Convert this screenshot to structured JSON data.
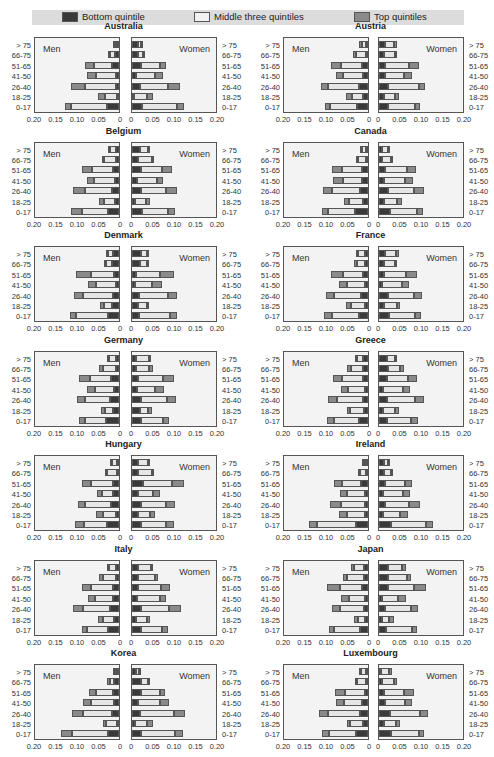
{
  "legend": {
    "items": [
      {
        "label": "Bottom quintile",
        "color": "#3a3a3a"
      },
      {
        "label": "Middle three quintiles",
        "color": "#e6e6e6"
      },
      {
        "label": "Top quintiles",
        "color": "#8a8a8a"
      }
    ]
  },
  "labels": {
    "men": "Men",
    "women": "Women"
  },
  "chart_data": {
    "type": "bar",
    "subtype": "population-pyramid (stacked horizontal, mirrored)",
    "age_groups": [
      "> 75",
      "66-75",
      "51-65",
      "41-50",
      "26-40",
      "18-25",
      "0-17"
    ],
    "segments": [
      "Bottom quintile",
      "Middle three quintiles",
      "Top quintiles"
    ],
    "x_ticks_men": [
      "0.20",
      "0.15",
      "0.10",
      "0.05",
      "0"
    ],
    "x_ticks_women": [
      "0",
      "0.05",
      "0.10",
      "0.15",
      "0.20"
    ],
    "xlim": [
      0,
      0.2
    ],
    "note": "Each bar given as [bottom, middle, top] share widths; order of bars follows age_groups (top to bottom).",
    "countries": [
      {
        "name": "Australia",
        "men": [
          [
            0.005,
            0.005,
            0.004
          ],
          [
            0.011,
            0.011,
            0.003
          ],
          [
            0.016,
            0.043,
            0.021
          ],
          [
            0.006,
            0.048,
            0.02
          ],
          [
            0.008,
            0.07,
            0.033
          ],
          [
            0.003,
            0.03,
            0.016
          ],
          [
            0.027,
            0.085,
            0.014
          ]
        ],
        "women": [
          [
            0.015,
            0.008,
            0.002
          ],
          [
            0.015,
            0.012,
            0.003
          ],
          [
            0.022,
            0.043,
            0.015
          ],
          [
            0.009,
            0.045,
            0.018
          ],
          [
            0.018,
            0.065,
            0.028
          ],
          [
            0.005,
            0.03,
            0.013
          ],
          [
            0.023,
            0.082,
            0.015
          ]
        ]
      },
      {
        "name": "Austria",
        "men": [
          [
            0.003,
            0.012,
            0.005
          ],
          [
            0.005,
            0.023,
            0.006
          ],
          [
            0.013,
            0.05,
            0.022
          ],
          [
            0.011,
            0.048,
            0.016
          ],
          [
            0.022,
            0.07,
            0.018
          ],
          [
            0.012,
            0.025,
            0.014
          ],
          [
            0.025,
            0.063,
            0.012
          ]
        ],
        "women": [
          [
            0.015,
            0.02,
            0.006
          ],
          [
            0.012,
            0.025,
            0.006
          ],
          [
            0.015,
            0.055,
            0.022
          ],
          [
            0.013,
            0.045,
            0.018
          ],
          [
            0.022,
            0.07,
            0.016
          ],
          [
            0.012,
            0.025,
            0.01
          ],
          [
            0.022,
            0.062,
            0.012
          ]
        ]
      },
      {
        "name": "Belgium",
        "men": [
          [
            0.008,
            0.016,
            0.002
          ],
          [
            0.008,
            0.03,
            0.002
          ],
          [
            0.013,
            0.05,
            0.022
          ],
          [
            0.01,
            0.048,
            0.017
          ],
          [
            0.016,
            0.062,
            0.03
          ],
          [
            0.01,
            0.025,
            0.011
          ],
          [
            0.025,
            0.062,
            0.025
          ]
        ],
        "women": [
          [
            0.02,
            0.02,
            0.002
          ],
          [
            0.015,
            0.032,
            0.003
          ],
          [
            0.02,
            0.05,
            0.022
          ],
          [
            0.012,
            0.045,
            0.016
          ],
          [
            0.022,
            0.058,
            0.025
          ],
          [
            0.008,
            0.025,
            0.01
          ],
          [
            0.023,
            0.06,
            0.018
          ]
        ]
      },
      {
        "name": "Canada",
        "men": [
          [
            0.004,
            0.012,
            0.002
          ],
          [
            0.004,
            0.02,
            0.003
          ],
          [
            0.015,
            0.046,
            0.022
          ],
          [
            0.013,
            0.046,
            0.022
          ],
          [
            0.018,
            0.065,
            0.022
          ],
          [
            0.012,
            0.032,
            0.012
          ],
          [
            0.03,
            0.063,
            0.015
          ]
        ],
        "women": [
          [
            0.006,
            0.016,
            0.003
          ],
          [
            0.006,
            0.023,
            0.003
          ],
          [
            0.015,
            0.05,
            0.022
          ],
          [
            0.012,
            0.048,
            0.018
          ],
          [
            0.02,
            0.062,
            0.022
          ],
          [
            0.012,
            0.03,
            0.012
          ],
          [
            0.025,
            0.063,
            0.015
          ]
        ]
      },
      {
        "name": "Denmark",
        "men": [
          [
            0.014,
            0.014,
            0.003
          ],
          [
            0.017,
            0.016,
            0.003
          ],
          [
            0.012,
            0.052,
            0.035
          ],
          [
            0.008,
            0.045,
            0.02
          ],
          [
            0.015,
            0.068,
            0.022
          ],
          [
            0.016,
            0.02,
            0.008
          ],
          [
            0.025,
            0.075,
            0.015
          ]
        ],
        "women": [
          [
            0.022,
            0.015,
            0.002
          ],
          [
            0.02,
            0.017,
            0.002
          ],
          [
            0.01,
            0.055,
            0.032
          ],
          [
            0.007,
            0.04,
            0.023
          ],
          [
            0.017,
            0.067,
            0.02
          ],
          [
            0.015,
            0.02,
            0.005
          ],
          [
            0.016,
            0.072,
            0.017
          ]
        ]
      },
      {
        "name": "France",
        "men": [
          [
            0.008,
            0.015,
            0.006
          ],
          [
            0.007,
            0.019,
            0.006
          ],
          [
            0.012,
            0.046,
            0.027
          ],
          [
            0.007,
            0.043,
            0.018
          ],
          [
            0.017,
            0.062,
            0.018
          ],
          [
            0.008,
            0.031,
            0.013
          ],
          [
            0.022,
            0.062,
            0.018
          ]
        ],
        "women": [
          [
            0.015,
            0.024,
            0.007
          ],
          [
            0.011,
            0.026,
            0.006
          ],
          [
            0.012,
            0.05,
            0.026
          ],
          [
            0.008,
            0.046,
            0.016
          ],
          [
            0.02,
            0.062,
            0.017
          ],
          [
            0.011,
            0.031,
            0.008
          ],
          [
            0.023,
            0.06,
            0.015
          ]
        ]
      },
      {
        "name": "Germany",
        "men": [
          [
            0.007,
            0.018,
            0.002
          ],
          [
            0.007,
            0.03,
            0.01
          ],
          [
            0.018,
            0.05,
            0.025
          ],
          [
            0.012,
            0.044,
            0.018
          ],
          [
            0.02,
            0.06,
            0.018
          ],
          [
            0.013,
            0.02,
            0.008
          ],
          [
            0.03,
            0.05,
            0.012
          ]
        ],
        "women": [
          [
            0.01,
            0.03,
            0.005
          ],
          [
            0.01,
            0.03,
            0.008
          ],
          [
            0.014,
            0.057,
            0.027
          ],
          [
            0.012,
            0.042,
            0.02
          ],
          [
            0.022,
            0.06,
            0.02
          ],
          [
            0.018,
            0.02,
            0.008
          ],
          [
            0.022,
            0.05,
            0.014
          ]
        ]
      },
      {
        "name": "Greece",
        "men": [
          [
            0.012,
            0.014,
            0.004
          ],
          [
            0.012,
            0.028,
            0.008
          ],
          [
            0.012,
            0.048,
            0.022
          ],
          [
            0.008,
            0.038,
            0.016
          ],
          [
            0.012,
            0.06,
            0.022
          ],
          [
            0.009,
            0.032,
            0.008
          ],
          [
            0.02,
            0.06,
            0.015
          ]
        ],
        "women": [
          [
            0.018,
            0.02,
            0.004
          ],
          [
            0.022,
            0.028,
            0.008
          ],
          [
            0.018,
            0.05,
            0.02
          ],
          [
            0.01,
            0.045,
            0.018
          ],
          [
            0.018,
            0.066,
            0.02
          ],
          [
            0.01,
            0.028,
            0.008
          ],
          [
            0.018,
            0.056,
            0.016
          ]
        ]
      },
      {
        "name": "Hungary",
        "men": [
          [
            0.003,
            0.017,
            0.002
          ],
          [
            0.003,
            0.027,
            0.003
          ],
          [
            0.015,
            0.05,
            0.02
          ],
          [
            0.014,
            0.025,
            0.013
          ],
          [
            0.018,
            0.06,
            0.018
          ],
          [
            0.008,
            0.03,
            0.016
          ],
          [
            0.027,
            0.055,
            0.02
          ]
        ],
        "women": [
          [
            0.015,
            0.025,
            0.003
          ],
          [
            0.015,
            0.032,
            0.004
          ],
          [
            0.025,
            0.068,
            0.027
          ],
          [
            0.013,
            0.035,
            0.018
          ],
          [
            0.02,
            0.06,
            0.02
          ],
          [
            0.013,
            0.028,
            0.012
          ],
          [
            0.02,
            0.06,
            0.018
          ]
        ]
      },
      {
        "name": "Ireland",
        "men": [
          [
            0.005,
            0.008,
            0.002
          ],
          [
            0.005,
            0.015,
            0.003
          ],
          [
            0.017,
            0.043,
            0.02
          ],
          [
            0.008,
            0.042,
            0.015
          ],
          [
            0.008,
            0.055,
            0.025
          ],
          [
            0.008,
            0.042,
            0.018
          ],
          [
            0.028,
            0.09,
            0.02
          ]
        ],
        "women": [
          [
            0.012,
            0.012,
            0.002
          ],
          [
            0.012,
            0.017,
            0.003
          ],
          [
            0.015,
            0.046,
            0.016
          ],
          [
            0.01,
            0.046,
            0.016
          ],
          [
            0.015,
            0.055,
            0.025
          ],
          [
            0.01,
            0.04,
            0.018
          ],
          [
            0.027,
            0.083,
            0.015
          ]
        ]
      },
      {
        "name": "Italy",
        "men": [
          [
            0.008,
            0.016,
            0.003
          ],
          [
            0.008,
            0.03,
            0.008
          ],
          [
            0.015,
            0.05,
            0.02
          ],
          [
            0.015,
            0.04,
            0.018
          ],
          [
            0.022,
            0.062,
            0.022
          ],
          [
            0.012,
            0.025,
            0.013
          ],
          [
            0.025,
            0.05,
            0.012
          ]
        ],
        "women": [
          [
            0.015,
            0.03,
            0.005
          ],
          [
            0.015,
            0.038,
            0.008
          ],
          [
            0.015,
            0.052,
            0.022
          ],
          [
            0.012,
            0.052,
            0.016
          ],
          [
            0.02,
            0.065,
            0.03
          ],
          [
            0.01,
            0.025,
            0.008
          ],
          [
            0.02,
            0.05,
            0.013
          ]
        ]
      },
      {
        "name": "Japan",
        "men": [
          [
            0.01,
            0.022,
            0.008
          ],
          [
            0.01,
            0.038,
            0.01
          ],
          [
            0.015,
            0.05,
            0.03
          ],
          [
            0.008,
            0.036,
            0.018
          ],
          [
            0.01,
            0.055,
            0.018
          ],
          [
            0.006,
            0.018,
            0.008
          ],
          [
            0.018,
            0.06,
            0.013
          ]
        ],
        "women": [
          [
            0.022,
            0.032,
            0.008
          ],
          [
            0.02,
            0.046,
            0.008
          ],
          [
            0.02,
            0.062,
            0.027
          ],
          [
            0.008,
            0.036,
            0.018
          ],
          [
            0.015,
            0.06,
            0.016
          ],
          [
            0.008,
            0.016,
            0.01
          ],
          [
            0.016,
            0.06,
            0.013
          ]
        ]
      },
      {
        "name": "Korea",
        "men": [
          [
            0.002,
            0.004,
            0.002
          ],
          [
            0.012,
            0.01,
            0.005
          ],
          [
            0.013,
            0.04,
            0.018
          ],
          [
            0.012,
            0.052,
            0.02
          ],
          [
            0.016,
            0.068,
            0.025
          ],
          [
            0.005,
            0.025,
            0.008
          ],
          [
            0.025,
            0.085,
            0.025
          ]
        ],
        "women": [
          [
            0.01,
            0.008,
            0.002
          ],
          [
            0.022,
            0.015,
            0.005
          ],
          [
            0.022,
            0.042,
            0.012
          ],
          [
            0.015,
            0.05,
            0.02
          ],
          [
            0.018,
            0.08,
            0.025
          ],
          [
            0.008,
            0.028,
            0.012
          ],
          [
            0.022,
            0.077,
            0.02
          ]
        ]
      },
      {
        "name": "Luxembourg",
        "men": [
          [
            0.005,
            0.012,
            0.003
          ],
          [
            0.005,
            0.02,
            0.005
          ],
          [
            0.008,
            0.046,
            0.022
          ],
          [
            0.013,
            0.043,
            0.018
          ],
          [
            0.018,
            0.075,
            0.022
          ],
          [
            0.012,
            0.03,
            0.008
          ],
          [
            0.028,
            0.063,
            0.015
          ]
        ],
        "women": [
          [
            0.004,
            0.02,
            0.006
          ],
          [
            0.006,
            0.03,
            0.006
          ],
          [
            0.012,
            0.046,
            0.024
          ],
          [
            0.015,
            0.046,
            0.015
          ],
          [
            0.025,
            0.07,
            0.02
          ],
          [
            0.012,
            0.027,
            0.01
          ],
          [
            0.028,
            0.065,
            0.012
          ]
        ]
      }
    ]
  }
}
